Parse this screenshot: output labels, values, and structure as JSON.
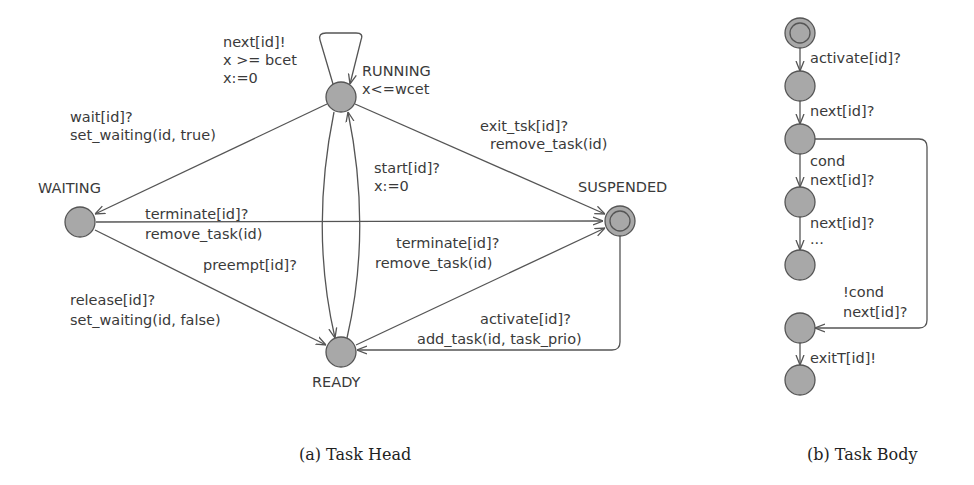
{
  "colors": {
    "node_fill": "#a8a8a8",
    "node_stroke": "#555555",
    "edge": "#555555",
    "text": "#3a3a3a"
  },
  "task_head": {
    "caption": "(a) Task Head",
    "states": {
      "running": {
        "name": "RUNNING",
        "invariant": "x<=wcet"
      },
      "waiting": {
        "name": "WAITING"
      },
      "suspended": {
        "name": "SUSPENDED",
        "initial": true
      },
      "ready": {
        "name": "READY"
      }
    },
    "edges": {
      "running_self": {
        "sync": "next[id]!",
        "guard": "x >= bcet",
        "update": "x:=0"
      },
      "running_to_waiting": {
        "sync": "wait[id]?",
        "update": "set_waiting(id, true)"
      },
      "running_to_suspended": {
        "sync": "exit_tsk[id]?",
        "update": "remove_task(id)"
      },
      "ready_to_running": {
        "sync": "start[id]?",
        "update": "x:=0"
      },
      "waiting_to_suspended": {
        "sync": "terminate[id]?",
        "update": "remove_task(id)"
      },
      "running_to_ready": {
        "sync": "preempt[id]?"
      },
      "ready_to_suspended": {
        "sync": "terminate[id]?",
        "update": "remove_task(id)"
      },
      "waiting_to_ready": {
        "sync": "release[id]?",
        "update": "set_waiting(id, false)"
      },
      "suspended_to_ready": {
        "sync": "activate[id]?",
        "update": "add_task(id, task_prio)"
      }
    }
  },
  "task_body": {
    "caption": "(b) Task Body",
    "edges": {
      "e1": {
        "sync": "activate[id]?"
      },
      "e2": {
        "sync": "next[id]?"
      },
      "e3": {
        "guard": "cond",
        "sync": "next[id]?"
      },
      "e4": {
        "sync": "next[id]?",
        "more": "..."
      },
      "e5": {
        "guard": "!cond",
        "sync": "next[id]?"
      },
      "e6": {
        "sync": "exitT[id]!"
      }
    }
  }
}
